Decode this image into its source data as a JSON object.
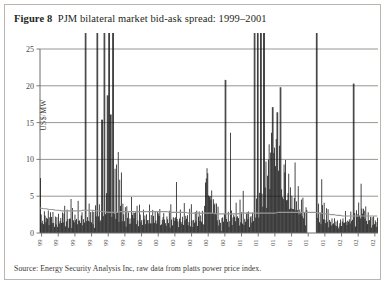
{
  "figure": {
    "number_label": "Figure 8",
    "title_text": "PJM bilateral market bid-ask spread: 1999–2001",
    "source_note": "Source: Energy Security Analysis Inc, raw data from platts power price index."
  },
  "colors": {
    "series_fill": "#0d0d0d",
    "gridline": "#8d8a86",
    "axis": "#6f6c68",
    "trend_line": "#9a9793",
    "frame_border": "#b9b5b0",
    "text": "#231f20",
    "background": "#ffffff"
  },
  "chart_data": {
    "type": "area",
    "title": "PJM bilateral market bid-ask spread: 1999–2001",
    "xlabel": "",
    "ylabel": "US$/MW",
    "ylim": [
      0,
      25
    ],
    "yticks": [
      0,
      5,
      10,
      15,
      20,
      25
    ],
    "ytick_labels": [
      "0",
      "5",
      "10",
      "15",
      "20",
      "25"
    ],
    "grid": true,
    "legend": "none",
    "xtick_labels": [
      "1/4/99",
      "3/4/99",
      "5/4/99",
      "7/4/99",
      "9/4/99",
      "11/4/99",
      "1/4/00",
      "3/4/00",
      "5/4/00",
      "7/4/00",
      "9/4/00",
      "11/4/00",
      "1/4/01",
      "3/4/01",
      "5/4/01",
      "7/4/01",
      "9/4/01",
      "11/4/01",
      "1/4/02",
      "3/4/02",
      "5/4/02"
    ],
    "x_range_start": "1/4/99",
    "x_range_end": "5/4/02",
    "n_points": 430,
    "series": [
      {
        "name": "Bid-ask spread",
        "units": "US$/MW",
        "baseline_level": 1.9,
        "notes": "daily spread, dense vertical bars from zero baseline; several spikes clipped at top of axis (>25)",
        "values": [
          6.8,
          2.1,
          1.4,
          2.6,
          1.2,
          3.0,
          1.8,
          1.1,
          2.4,
          1.5,
          2.9,
          1.3,
          2.0,
          3.4,
          1.6,
          1.1,
          2.5,
          1.9,
          1.2,
          2.8,
          1.4,
          2.2,
          1.0,
          3.1,
          1.7,
          1.3,
          2.6,
          1.1,
          2.0,
          1.5,
          2.3,
          4.1,
          1.2,
          1.8,
          2.7,
          1.4,
          1.0,
          2.2,
          1.6,
          3.3,
          1.1,
          2.5,
          1.9,
          1.3,
          2.8,
          1.5,
          2.1,
          1.2,
          4.6,
          1.7,
          2.4,
          1.0,
          1.9,
          3.0,
          1.4,
          2.2,
          1.6,
          1.1,
          25.5,
          2.0,
          2.8,
          1.3,
          4.9,
          1.8,
          2.5,
          1.2,
          3.6,
          1.5,
          2.1,
          1.0,
          2.9,
          1.7,
          1.4,
          25.8,
          2.3,
          3.1,
          1.2,
          2.0,
          1.6,
          15.4,
          2.7,
          1.3,
          25.2,
          1.9,
          6.2,
          2.4,
          18.7,
          1.5,
          25.9,
          2.2,
          16.1,
          1.8,
          3.5,
          25.4,
          2.6,
          11.2,
          1.4,
          9.8,
          2.1,
          13.5,
          1.7,
          5.2,
          2.9,
          6.7,
          1.3,
          3.8,
          2.2,
          1.6,
          4.4,
          1.2,
          2.7,
          1.9,
          3.2,
          1.4,
          2.5,
          1.1,
          3.9,
          1.8,
          2.3,
          1.5,
          2.0,
          3.6,
          1.2,
          2.8,
          1.6,
          1.3,
          4.2,
          2.1,
          1.9,
          2.6,
          1.4,
          3.3,
          1.7,
          2.2,
          1.1,
          2.9,
          1.5,
          2.4,
          1.8,
          3.0,
          1.3,
          2.0,
          1.6,
          4.5,
          2.3,
          1.2,
          2.7,
          1.9,
          1.4,
          3.1,
          2.1,
          1.7,
          2.5,
          1.3,
          1.0,
          2.2,
          1.8,
          3.4,
          1.5,
          2.0,
          1.2,
          2.6,
          1.9,
          1.6,
          2.3,
          1.1,
          3.7,
          2.0,
          1.4,
          2.8,
          1.7,
          1.3,
          2.1,
          5.4,
          1.9,
          2.5,
          1.2,
          1.6,
          2.9,
          1.8,
          1.4,
          2.2,
          1.1,
          3.2,
          1.7,
          2.0,
          1.5,
          2.6,
          1.3,
          1.9,
          2.4,
          1.2,
          2.8,
          1.6,
          1.0,
          2.1,
          1.8,
          2.3,
          1.4,
          2.7,
          1.1,
          1.9,
          2.5,
          1.3,
          3.0,
          1.7,
          2.2,
          1.5,
          1.2,
          2.9,
          8.9,
          7.6,
          9.1,
          6.4,
          8.2,
          5.8,
          7.1,
          4.9,
          6.2,
          3.8,
          5.1,
          2.9,
          4.2,
          2.1,
          3.4,
          1.8,
          2.6,
          1.4,
          2.0,
          1.1,
          0.3,
          1.5,
          2.2,
          1.9,
          3.1,
          1.3,
          20.8,
          2.0,
          1.6,
          2.7,
          1.2,
          1.9,
          10.4,
          2.4,
          1.5,
          3.2,
          1.8,
          2.1,
          1.3,
          4.6,
          2.0,
          1.7,
          2.5,
          1.4,
          3.9,
          1.2,
          2.2,
          1.9,
          4.1,
          1.6,
          2.8,
          1.3,
          2.0,
          3.5,
          1.7,
          2.4,
          1.1,
          1.8,
          2.9,
          1.5,
          3.3,
          2.1,
          1.4,
          25.6,
          2.6,
          4.2,
          1.9,
          26.2,
          3.1,
          5.8,
          2.3,
          25.1,
          4.5,
          3.2,
          1.8,
          25.3,
          6.1,
          9.4,
          4.8,
          11.0,
          7.2,
          10.6,
          5.4,
          8.8,
          12.3,
          6.0,
          17.1,
          9.2,
          13.8,
          7.5,
          10.9,
          5.1,
          16.4,
          8.3,
          11.2,
          6.6,
          19.8,
          9.0,
          7.8,
          4.4,
          10.3,
          6.2,
          8.6,
          3.9,
          7.0,
          5.3,
          9.5,
          4.1,
          6.8,
          3.2,
          5.6,
          2.8,
          4.9,
          3.5,
          7.3,
          2.4,
          5.0,
          3.1,
          6.4,
          2.0,
          4.3,
          2.7,
          3.6,
          1.9,
          5.2,
          2.2,
          3.0,
          1.6,
          4.0,
          2.5,
          3.8,
          1.3,
          2.9,
          11.4,
          2.1,
          3.4,
          1.8,
          2.6,
          9.6,
          1.5,
          3.2,
          2.0,
          25.7,
          1.7,
          4.1,
          2.3,
          3.0,
          1.4,
          5.5,
          2.8,
          1.9,
          3.6,
          2.1,
          1.2,
          2.7,
          1.6,
          2.4,
          1.1,
          1.8,
          1.3,
          1.0,
          1.5,
          0.9,
          1.2,
          1.6,
          0.8,
          1.4,
          1.1,
          1.7,
          0.9,
          1.3,
          1.0,
          1.5,
          0.7,
          1.2,
          2.9,
          1.6,
          1.1,
          2.2,
          1.4,
          0.9,
          1.8,
          1.2,
          2.0,
          1.5,
          3.1,
          1.3,
          2.4,
          1.7,
          20.3,
          2.1,
          1.4,
          3.8,
          2.6,
          1.9,
          4.9,
          3.2,
          2.3,
          5.1,
          3.6,
          2.0,
          4.2,
          2.8,
          1.6,
          3.4,
          2.2,
          1.9,
          2.6,
          1.4,
          2.1,
          1.7,
          1.2,
          2.3,
          1.5,
          1.9,
          1.1,
          2.0,
          1.6,
          1.3,
          1.8
        ]
      }
    ],
    "trend_line": {
      "name": "smoothed average",
      "values": [
        3.4,
        3.3,
        3.3,
        3.2,
        3.2,
        3.1,
        3.1,
        3.0,
        3.0,
        3.0,
        3.0,
        3.0,
        3.0,
        3.0,
        3.1,
        3.1,
        3.1,
        3.1,
        3.0,
        3.0,
        2.9,
        2.9,
        2.8,
        2.8,
        2.8,
        2.8,
        2.9,
        2.9,
        2.9,
        2.9,
        2.9,
        2.9,
        2.9,
        2.9,
        2.9,
        2.9,
        2.9,
        2.9,
        2.9,
        2.9,
        2.9,
        2.9,
        2.8,
        2.8,
        2.8,
        2.8,
        2.8,
        2.8,
        2.7,
        2.7,
        2.7,
        2.7,
        2.7,
        2.7,
        2.7,
        2.7,
        2.7,
        2.6,
        2.6,
        2.6,
        2.6,
        2.6,
        2.6,
        2.6,
        2.6,
        2.7,
        2.7,
        2.7,
        2.7,
        2.7,
        2.7,
        2.7,
        2.7,
        2.7,
        2.7,
        2.7,
        2.7,
        2.8,
        2.8,
        2.8,
        2.8,
        2.8,
        2.8,
        2.8,
        2.8,
        2.8,
        2.8,
        2.8,
        2.8,
        2.8,
        2.7,
        2.7,
        2.6,
        2.6,
        2.5,
        2.5,
        2.4,
        2.4,
        2.3,
        2.3,
        2.3,
        2.3,
        2.3,
        2.3,
        2.3,
        2.3,
        2.3,
        2.3,
        2.3,
        2.3
      ]
    },
    "annotations": [
      {
        "text": "spikes clipped above axis maximum",
        "value": 25
      }
    ]
  }
}
